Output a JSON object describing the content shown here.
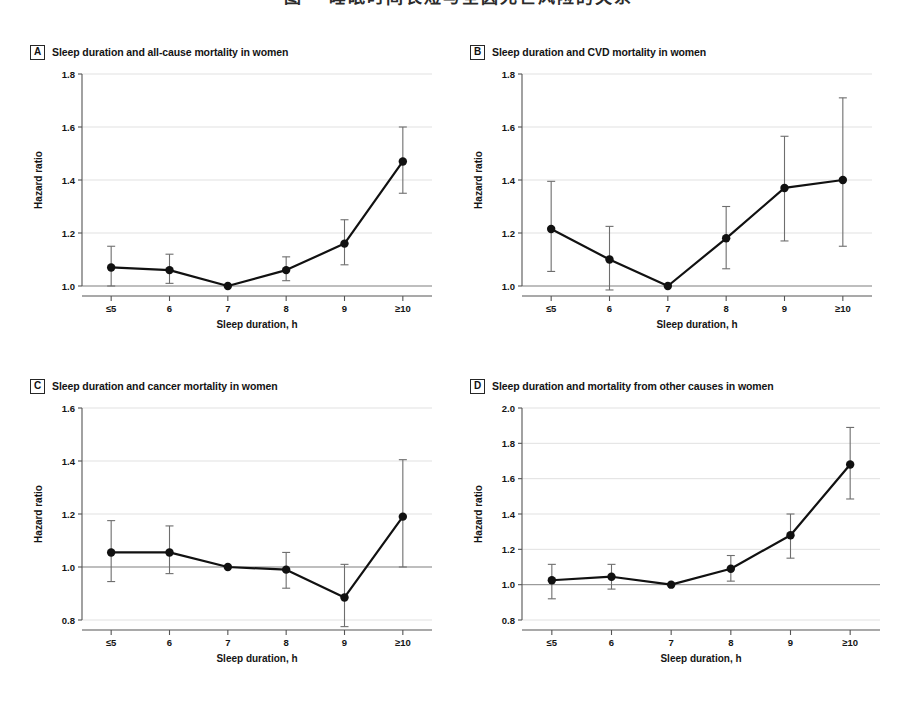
{
  "figure": {
    "top_caption": "图一 睡眠时间长短与全因死亡风险的关系",
    "background": "#ffffff",
    "ink_color": "#111111",
    "grid_color": "#d9d9d9",
    "reference_line_color": "#8c8c8c"
  },
  "panels": [
    {
      "letter": "A",
      "title": "Sleep duration and all-cause mortality in women",
      "chart_data": {
        "type": "line",
        "title": "Sleep duration and all-cause mortality in women",
        "xlabel": "Sleep duration, h",
        "ylabel": "Hazard ratio",
        "categories": [
          "≤5",
          "6",
          "7",
          "8",
          "9",
          "≥10"
        ],
        "values": [
          1.07,
          1.06,
          1.0,
          1.06,
          1.16,
          1.47
        ],
        "ci_lower": [
          1.0,
          1.01,
          1.0,
          1.02,
          1.08,
          1.35
        ],
        "ci_upper": [
          1.15,
          1.12,
          1.0,
          1.11,
          1.25,
          1.6
        ],
        "ylim": [
          1.0,
          1.8
        ],
        "yticks": [
          "1.0",
          "1.2",
          "1.4",
          "1.6",
          "1.8"
        ],
        "reference_value": 1.0,
        "grid": true,
        "legend": "none"
      }
    },
    {
      "letter": "B",
      "title": "Sleep duration and CVD mortality in women",
      "chart_data": {
        "type": "line",
        "title": "Sleep duration and CVD mortality in women",
        "xlabel": "Sleep duration, h",
        "ylabel": "Hazard ratio",
        "categories": [
          "≤5",
          "6",
          "7",
          "8",
          "9",
          "≥10"
        ],
        "values": [
          1.215,
          1.1,
          1.0,
          1.18,
          1.37,
          1.4
        ],
        "ci_lower": [
          1.055,
          0.985,
          1.0,
          1.065,
          1.17,
          1.15
        ],
        "ci_upper": [
          1.395,
          1.225,
          1.0,
          1.3,
          1.565,
          1.71
        ],
        "ylim": [
          1.0,
          1.8
        ],
        "yticks": [
          "1.0",
          "1.2",
          "1.4",
          "1.6",
          "1.8"
        ],
        "reference_value": 1.0,
        "grid": true,
        "legend": "none"
      }
    },
    {
      "letter": "C",
      "title": "Sleep duration and cancer mortality in women",
      "chart_data": {
        "type": "line",
        "title": "Sleep duration and cancer mortality in women",
        "xlabel": "Sleep duration, h",
        "ylabel": "Hazard ratio",
        "categories": [
          "≤5",
          "6",
          "7",
          "8",
          "9",
          "≥10"
        ],
        "values": [
          1.055,
          1.055,
          1.0,
          0.99,
          0.885,
          1.19
        ],
        "ci_lower": [
          0.945,
          0.975,
          1.0,
          0.92,
          0.775,
          1.0
        ],
        "ci_upper": [
          1.175,
          1.155,
          1.0,
          1.055,
          1.01,
          1.405
        ],
        "ylim": [
          0.8,
          1.6
        ],
        "yticks": [
          "0.8",
          "1.0",
          "1.2",
          "1.4",
          "1.6"
        ],
        "reference_value": 1.0,
        "grid": true,
        "legend": "none"
      }
    },
    {
      "letter": "D",
      "title": "Sleep duration and mortality from other causes in women",
      "chart_data": {
        "type": "line",
        "title": "Sleep duration and mortality from other causes in women",
        "xlabel": "Sleep duration, h",
        "ylabel": "Hazard ratio",
        "categories": [
          "≤5",
          "6",
          "7",
          "8",
          "9",
          "≥10"
        ],
        "values": [
          1.025,
          1.045,
          1.0,
          1.09,
          1.28,
          1.68
        ],
        "ci_lower": [
          0.92,
          0.975,
          1.0,
          1.02,
          1.15,
          1.485
        ],
        "ci_upper": [
          1.115,
          1.115,
          1.0,
          1.165,
          1.4,
          1.89
        ],
        "ylim": [
          0.8,
          2.0
        ],
        "yticks": [
          "0.8",
          "1.0",
          "1.2",
          "1.4",
          "1.6",
          "1.8",
          "2.0"
        ],
        "reference_value": 1.0,
        "grid": true,
        "legend": "none"
      }
    }
  ]
}
